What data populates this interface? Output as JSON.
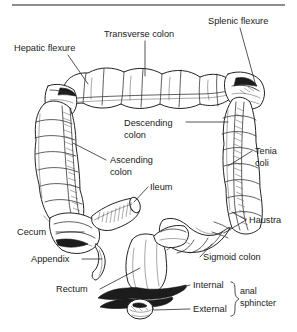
{
  "figure": {
    "top_rule": {
      "visible": true,
      "color": "#8d8d8d"
    },
    "background_color": "#ffffff",
    "ink_color": "#1a1a1a"
  },
  "labels": [
    {
      "id": "hepatic-flexure",
      "text": "Hepatic flexure",
      "x": 14,
      "y": 51,
      "anchor": "start"
    },
    {
      "id": "transverse-colon",
      "text": "Transverse colon",
      "x": 104,
      "y": 37,
      "anchor": "start"
    },
    {
      "id": "splenic-flexure",
      "text": "Splenic flexure",
      "x": 208,
      "y": 24,
      "anchor": "start"
    },
    {
      "id": "descending-colon-1",
      "text": "Descending",
      "x": 124,
      "y": 126,
      "anchor": "start"
    },
    {
      "id": "descending-colon-2",
      "text": "colon",
      "x": 124,
      "y": 138,
      "anchor": "start"
    },
    {
      "id": "ascending-colon-1",
      "text": "Ascending",
      "x": 110,
      "y": 163,
      "anchor": "start"
    },
    {
      "id": "ascending-colon-2",
      "text": "colon",
      "x": 110,
      "y": 175,
      "anchor": "start"
    },
    {
      "id": "tenia-coli-1",
      "text": "Tenia",
      "x": 255,
      "y": 154,
      "anchor": "start"
    },
    {
      "id": "tenia-coli-2",
      "text": "coli",
      "x": 255,
      "y": 166,
      "anchor": "start"
    },
    {
      "id": "ileum",
      "text": "Ileum",
      "x": 150,
      "y": 190,
      "anchor": "start"
    },
    {
      "id": "haustra",
      "text": "Haustra",
      "x": 249,
      "y": 223,
      "anchor": "start"
    },
    {
      "id": "cecum",
      "text": "Cecum",
      "x": 17,
      "y": 235,
      "anchor": "start"
    },
    {
      "id": "appendix",
      "text": "Appendix",
      "x": 31,
      "y": 262,
      "anchor": "start"
    },
    {
      "id": "sigmoid-colon",
      "text": "Sigmoid colon",
      "x": 203,
      "y": 260,
      "anchor": "start"
    },
    {
      "id": "rectum",
      "text": "Rectum",
      "x": 56,
      "y": 292,
      "anchor": "start"
    },
    {
      "id": "internal",
      "text": "Internal",
      "x": 193,
      "y": 288,
      "anchor": "start"
    },
    {
      "id": "external",
      "text": "External",
      "x": 193,
      "y": 312,
      "anchor": "start"
    },
    {
      "id": "anal-sphincter-1",
      "text": "anal",
      "x": 240,
      "y": 294,
      "anchor": "start"
    },
    {
      "id": "anal-sphincter-2",
      "text": "sphincter",
      "x": 240,
      "y": 306,
      "anchor": "start"
    }
  ],
  "structures": [
    {
      "id": "transverse-colon",
      "name": "Transverse colon"
    },
    {
      "id": "ascending-colon",
      "name": "Ascending colon"
    },
    {
      "id": "descending-colon",
      "name": "Descending colon"
    },
    {
      "id": "sigmoid-colon",
      "name": "Sigmoid colon"
    },
    {
      "id": "cecum",
      "name": "Cecum"
    },
    {
      "id": "appendix",
      "name": "Appendix"
    },
    {
      "id": "ileum",
      "name": "Ileum"
    },
    {
      "id": "rectum",
      "name": "Rectum"
    },
    {
      "id": "hepatic-flexure",
      "name": "Hepatic flexure"
    },
    {
      "id": "splenic-flexure",
      "name": "Splenic flexure"
    },
    {
      "id": "tenia-coli",
      "name": "Tenia coli"
    },
    {
      "id": "haustra",
      "name": "Haustra"
    },
    {
      "id": "internal-anal-sphincter",
      "name": "Internal anal sphincter"
    },
    {
      "id": "external-anal-sphincter",
      "name": "External anal sphincter"
    }
  ]
}
